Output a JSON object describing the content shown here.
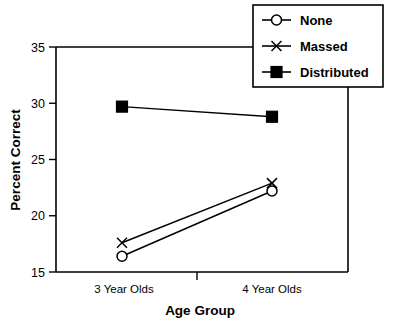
{
  "chart_data": {
    "type": "line",
    "title": "",
    "xlabel": "Age Group",
    "ylabel": "Percent Correct",
    "categories": [
      "3 Year Olds",
      "4 Year Olds"
    ],
    "x": [
      1,
      2
    ],
    "xlim": [
      0.5,
      2.5
    ],
    "ylim": [
      15,
      35
    ],
    "yticks": [
      15,
      20,
      25,
      30,
      35
    ],
    "ytick_labels": [
      "15",
      "20",
      "25",
      "30",
      "35"
    ],
    "grid": false,
    "legend_position": "top-right",
    "series": [
      {
        "name": "None",
        "marker": "open-circle",
        "values": [
          16.4,
          22.2
        ]
      },
      {
        "name": "Massed",
        "marker": "x",
        "values": [
          17.6,
          22.9
        ]
      },
      {
        "name": "Distributed",
        "marker": "filled-square",
        "values": [
          29.7,
          28.8
        ]
      }
    ],
    "colors": {
      "axis": "#000000",
      "series": "#000000",
      "background": "#ffffff"
    }
  },
  "axes": {
    "y_tick_0": "15",
    "y_tick_1": "20",
    "y_tick_2": "25",
    "y_tick_3": "30",
    "y_tick_4": "35",
    "y_title": "Percent Correct",
    "x_title": "Age Group",
    "x_cat_0": "3 Year Olds",
    "x_cat_1": "4 Year Olds"
  },
  "legend": {
    "entries": [
      {
        "label": "None"
      },
      {
        "label": "Massed"
      },
      {
        "label": "Distributed"
      }
    ]
  }
}
